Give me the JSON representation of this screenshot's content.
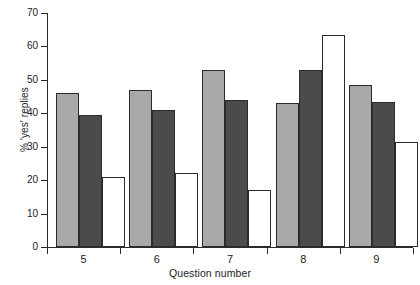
{
  "chart_data": {
    "type": "bar",
    "title": "",
    "xlabel": "Question number",
    "ylabel": "% 'yes' replies",
    "categories": [
      "5",
      "6",
      "7",
      "8",
      "9"
    ],
    "ylim": [
      0,
      70
    ],
    "yticks": [
      0,
      10,
      20,
      30,
      40,
      50,
      60,
      70
    ],
    "ytick_labels": [
      "0",
      "10",
      "20",
      "30",
      "40",
      "50",
      "60",
      "70"
    ],
    "grid": false,
    "legend": "none",
    "series": [
      {
        "name": "series-1",
        "color": "#a9a9a9",
        "values": [
          46,
          47,
          53,
          43,
          48.5
        ]
      },
      {
        "name": "series-2",
        "color": "#4b4b4b",
        "values": [
          39.5,
          41,
          44,
          53,
          43.5
        ]
      },
      {
        "name": "series-3",
        "color": "#ffffff",
        "values": [
          21,
          22,
          17,
          63.5,
          31.5
        ]
      }
    ]
  },
  "axes": {
    "line_color": "#2b2b2b",
    "bar_outline_color": "#2b2b2b"
  }
}
